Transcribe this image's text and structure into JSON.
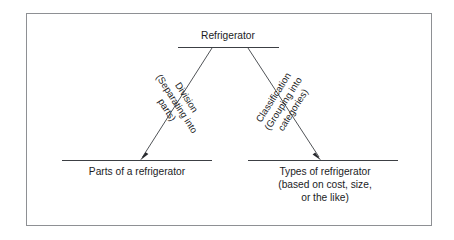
{
  "figure": {
    "kind": "division-and-classification-tree-diagram",
    "root": {
      "label": "Refrigerator"
    },
    "branches": [
      {
        "side": "left",
        "name": "division-branch",
        "label_lines": [
          "Division",
          "(Separating into",
          "parts)"
        ],
        "arrow": "down-left"
      },
      {
        "side": "right",
        "name": "classification-branch",
        "label_lines": [
          "Classification",
          "(Grouping into",
          "categories)"
        ],
        "arrow": "down-right"
      }
    ],
    "leaves": [
      {
        "name": "parts-of-a-refrigerator",
        "lines": [
          "Parts of a refrigerator"
        ]
      },
      {
        "name": "types-of-refrigerator",
        "lines": [
          "Types of refrigerator",
          "(based on cost, size,",
          "or the like)"
        ]
      }
    ],
    "colors": {
      "frame_border": "#8e9094",
      "rule": "#3c3f44",
      "text": "#1b1c1e",
      "background": "#ffffff"
    }
  }
}
